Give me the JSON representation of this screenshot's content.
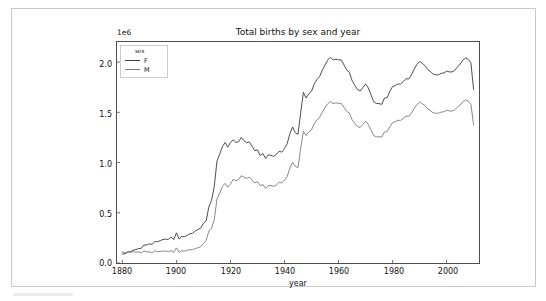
{
  "figure": {
    "title": "Total births by sex and year",
    "y_offset_label": "1e6",
    "x_axis_label": "year",
    "legend": {
      "title": "sex",
      "entries": [
        {
          "label": "F",
          "color": "#3a3a3a"
        },
        {
          "label": "M",
          "color": "#7a7a7a"
        }
      ]
    },
    "ticks": {
      "x": [
        "1880",
        "1900",
        "1920",
        "1940",
        "1960",
        "1980",
        "2000"
      ],
      "y": [
        "0.0",
        "0.5",
        "1.0",
        "1.5",
        "2.0"
      ]
    }
  },
  "chart_data": {
    "type": "line",
    "title": "Total births by sex and year",
    "xlabel": "year",
    "ylabel": "",
    "y_offset": "1e6",
    "xlim": [
      1878,
      2012
    ],
    "ylim": [
      0,
      2200000
    ],
    "yticks": [
      0,
      500000,
      1000000,
      1500000,
      2000000
    ],
    "xticks": [
      1880,
      1900,
      1920,
      1940,
      1960,
      1980,
      2000
    ],
    "grid": false,
    "legend_position": "upper left",
    "legend_title": "sex",
    "x": [
      1880,
      1881,
      1882,
      1883,
      1884,
      1885,
      1886,
      1887,
      1888,
      1889,
      1890,
      1891,
      1892,
      1893,
      1894,
      1895,
      1896,
      1897,
      1898,
      1899,
      1900,
      1901,
      1902,
      1903,
      1904,
      1905,
      1906,
      1907,
      1908,
      1909,
      1910,
      1911,
      1912,
      1913,
      1914,
      1915,
      1916,
      1917,
      1918,
      1919,
      1920,
      1921,
      1922,
      1923,
      1924,
      1925,
      1926,
      1927,
      1928,
      1929,
      1930,
      1931,
      1932,
      1933,
      1934,
      1935,
      1936,
      1937,
      1938,
      1939,
      1940,
      1941,
      1942,
      1943,
      1944,
      1945,
      1946,
      1947,
      1948,
      1949,
      1950,
      1951,
      1952,
      1953,
      1954,
      1955,
      1956,
      1957,
      1958,
      1959,
      1960,
      1961,
      1962,
      1963,
      1964,
      1965,
      1966,
      1967,
      1968,
      1969,
      1970,
      1971,
      1972,
      1973,
      1974,
      1975,
      1976,
      1977,
      1978,
      1979,
      1980,
      1981,
      1982,
      1983,
      1984,
      1985,
      1986,
      1987,
      1988,
      1989,
      1990,
      1991,
      1992,
      1993,
      1994,
      1995,
      1996,
      1997,
      1998,
      1999,
      2000,
      2001,
      2002,
      2003,
      2004,
      2005,
      2006,
      2007,
      2008,
      2009,
      2010
    ],
    "series": [
      {
        "name": "F",
        "color": "#3a3a3a",
        "values": [
          90993,
          91955,
          107851,
          112322,
          129021,
          133056,
          144538,
          145983,
          178631,
          178369,
          190377,
          185482,
          212347,
          212908,
          222923,
          233632,
          237924,
          234199,
          258770,
          233023,
          299873,
          239346,
          264080,
          261980,
          275372,
          291678,
          295300,
          318558,
          334141,
          347225,
          396417,
          418180,
          557459,
          624833,
          761316,
          1013538,
          1082091,
          1157549,
          1200019,
          1153443,
          1200343,
          1226044,
          1200772,
          1206425,
          1249668,
          1217723,
          1196430,
          1204534,
          1161676,
          1117427,
          1125702,
          1069318,
          1089830,
          1040365,
          1076155,
          1072812,
          1061030,
          1081176,
          1112475,
          1103426,
          1139712,
          1188395,
          1287609,
          1353747,
          1297834,
          1279566,
          1498119,
          1698712,
          1642653,
          1684167,
          1709167,
          1782582,
          1825167,
          1856968,
          1918795,
          1972172,
          2020228,
          2048857,
          2021164,
          2028675,
          2022169,
          2022705,
          1972907,
          1922332,
          1899000,
          1817164,
          1769518,
          1727337,
          1712180,
          1745447,
          1783306,
          1744316,
          1675905,
          1606085,
          1587830,
          1586420,
          1578902,
          1641673,
          1646832,
          1709312,
          1755286,
          1767374,
          1782046,
          1782161,
          1806471,
          1834705,
          1832120,
          1873232,
          1928622,
          1977081,
          2005925,
          1987589,
          1965401,
          1925318,
          1906180,
          1880384,
          1874100,
          1873204,
          1888098,
          1890554,
          1910196,
          1902195,
          1901923,
          1917088,
          1950406,
          1979440,
          2018683,
          2042745,
          2028146,
          1992710,
          1726166
        ]
      },
      {
        "name": "M",
        "color": "#7a7a7a",
        "values": [
          110493,
          100748,
          113687,
          104632,
          114445,
          107802,
          110784,
          101414,
          120851,
          110584,
          111026,
          101198,
          122039,
          112319,
          115775,
          117400,
          119570,
          112758,
          122692,
          106213,
          150499,
          106470,
          122660,
          119236,
          128128,
          132319,
          133055,
          144538,
          151952,
          163420,
          194198,
          225932,
          317837,
          347440,
          429806,
          637036,
          695371,
          760583,
          793296,
          755430,
          786690,
          831969,
          819036,
          829930,
          868722,
          854081,
          841884,
          854755,
          827532,
          795466,
          810272,
          769511,
          781621,
          742471,
          772252,
          770452,
          761572,
          777297,
          803271,
          796429,
          824417,
          861932,
          945175,
          1003088,
          962160,
          949353,
          1145828,
          1310447,
          1269436,
          1305402,
          1325661,
          1386879,
          1424236,
          1449884,
          1500502,
          1546537,
          1585165,
          1608696,
          1586669,
          1594386,
          1589435,
          1589506,
          1550441,
          1510303,
          1493098,
          1427669,
          1390035,
          1358179,
          1350236,
          1378487,
          1411462,
          1380502,
          1326673,
          1269921,
          1256312,
          1256161,
          1253433,
          1303777,
          1308741,
          1358448,
          1397043,
          1408137,
          1420567,
          1420293,
          1440240,
          1461939,
          1460667,
          1493239,
          1538014,
          1577530,
          1600825,
          1586239,
          1567836,
          1534584,
          1516797,
          1495672,
          1491013,
          1490371,
          1502887,
          1504476,
          1520363,
          1513803,
          1512428,
          1524546,
          1551244,
          1572843,
          1605125,
          1623800,
          1610675,
          1581154,
          1374953
        ]
      }
    ]
  }
}
